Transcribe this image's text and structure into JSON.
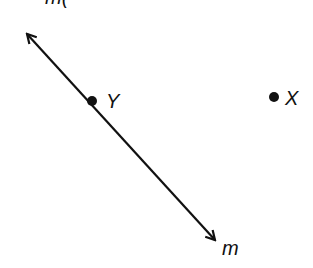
{
  "diagram": {
    "top_label": "m(",
    "line": {
      "name": "m",
      "label": "m",
      "start": [
        26,
        33
      ],
      "end": [
        216,
        241
      ],
      "color": "#111111"
    },
    "points": [
      {
        "name": "Y",
        "label": "Y",
        "x": 92,
        "y": 101
      },
      {
        "name": "X",
        "label": "X",
        "x": 274,
        "y": 97
      }
    ]
  }
}
